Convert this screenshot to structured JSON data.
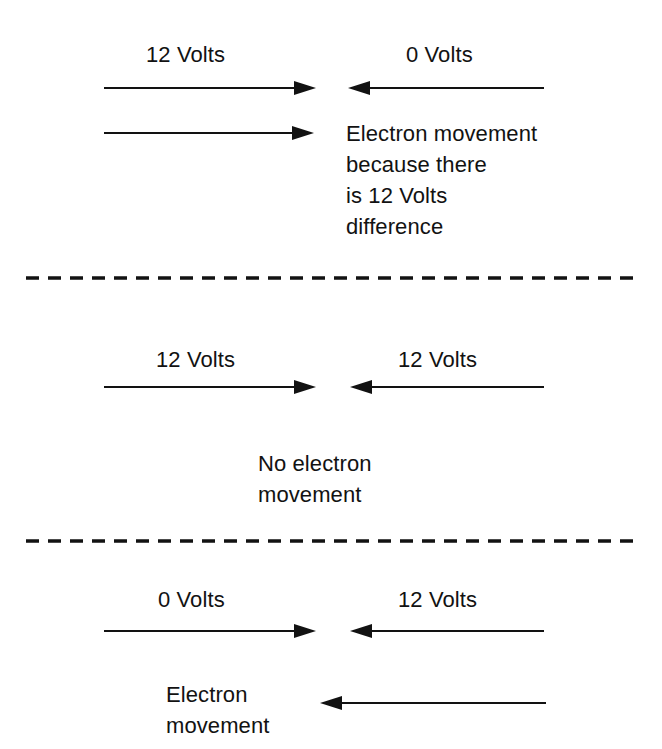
{
  "diagram": {
    "background_color": "#ffffff",
    "ink_color": "#121212",
    "width": 662,
    "height": 749
  },
  "sections": [
    {
      "id": "section-1",
      "left_label": "12 Volts",
      "right_label": "0 Volts",
      "left_arrow_direction": "right",
      "right_arrow_direction": "left",
      "extra_arrow_direction": "right",
      "note": "Electron movement\nbecause there\nis 12 Volts\ndifference"
    },
    {
      "id": "section-2",
      "left_label": "12 Volts",
      "right_label": "12 Volts",
      "left_arrow_direction": "right",
      "right_arrow_direction": "left",
      "note": "No electron\nmovement"
    },
    {
      "id": "section-3",
      "left_label": "0 Volts",
      "right_label": "12 Volts",
      "left_arrow_direction": "right",
      "right_arrow_direction": "left",
      "note": "Electron\nmovement",
      "result_arrow_direction": "left"
    }
  ],
  "dividers": [
    {
      "id": "divider-1",
      "style": "dashed"
    },
    {
      "id": "divider-2",
      "style": "dashed"
    }
  ]
}
